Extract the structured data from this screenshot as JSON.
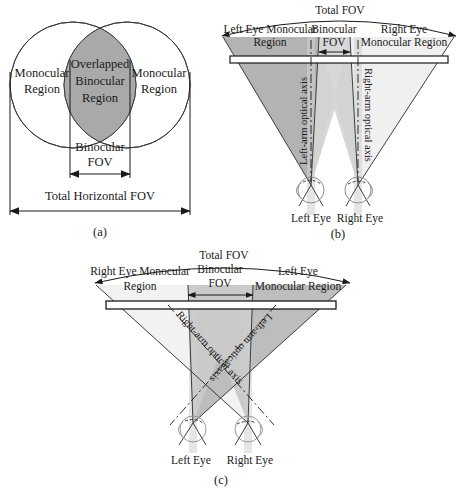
{
  "figure": {
    "panels": [
      {
        "id": "a",
        "caption": "(a)",
        "type": "venn-overlap",
        "labels": {
          "left_region": "Monocular\nRegion",
          "left_region_line1": "Monocular",
          "left_region_line2": "Region",
          "center_region_line1": "Overlapped",
          "center_region_line2": "Binocular",
          "center_region_line3": "Region",
          "right_region_line1": "Monocular",
          "right_region_line2": "Region",
          "binocular_fov_line1": "Binocular",
          "binocular_fov_line2": "FOV",
          "total_fov": "Total Horizontal FOV"
        }
      },
      {
        "id": "b",
        "caption": "(b)",
        "type": "diverging-eyes",
        "labels": {
          "total_fov": "Total FOV",
          "left_monocular_line1": "Left Eye Monocular",
          "left_monocular_line2": "Region",
          "binocular_line1": "Binocular",
          "binocular_line2": "FOV",
          "right_monocular_line1": "Right Eye",
          "right_monocular_line2": "Monocular Region",
          "left_axis": "Left-arm optical axis",
          "right_axis": "Right-arm optical axis",
          "left_eye": "Left Eye",
          "right_eye": "Right Eye"
        }
      },
      {
        "id": "c",
        "caption": "(c)",
        "type": "crossed-eyes",
        "labels": {
          "total_fov": "Total FOV",
          "left_monocular_line1": "Right Eye Monocular",
          "left_monocular_line2": "Region",
          "binocular_line1": "Binocular",
          "binocular_line2": "FOV",
          "right_monocular_line1": "Left Eye",
          "right_monocular_line2": "Monocular Region",
          "left_axis": "Right-arm optical axis",
          "right_axis": "Left-arm optical axis",
          "left_eye": "Left Eye",
          "right_eye": "Right Eye"
        }
      }
    ],
    "colors": {
      "stroke": "#1a1a1a",
      "fill_dark_gray": "#a9a9a9",
      "fill_mid_gray": "#c9c9c9",
      "fill_light_gray": "#e2e2e2",
      "fill_very_light": "#f2f2f2",
      "background": "#ffffff"
    }
  }
}
